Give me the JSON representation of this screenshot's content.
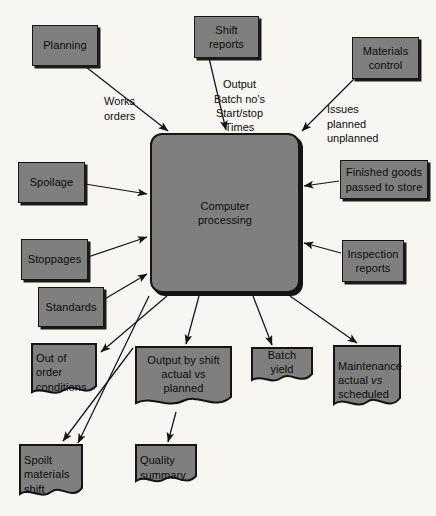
{
  "diagram": {
    "colors": {
      "node_fill": "#7f7f7f",
      "node_border": "#161616",
      "background": "#f7f6f3",
      "text": "#0b0b0b"
    },
    "process": {
      "label": "Computer\nprocessing",
      "line1": "Computer",
      "line2": "processing"
    },
    "inputs": [
      {
        "id": "planning",
        "label": "Planning"
      },
      {
        "id": "shift-reports",
        "label": "Shift\nreports",
        "line1": "Shift",
        "line2": "reports"
      },
      {
        "id": "materials-control",
        "label": "Materials\ncontrol",
        "line1": "Materials",
        "line2": "control"
      },
      {
        "id": "spoilage",
        "label": "Spoilage"
      },
      {
        "id": "stoppages",
        "label": "Stoppages"
      },
      {
        "id": "standards",
        "label": "Standards"
      },
      {
        "id": "finished-goods",
        "label": "Finished goods\npassed to store",
        "line1": "Finished goods",
        "line2": "passed to store"
      },
      {
        "id": "inspection-reports",
        "label": "Inspection\nreports",
        "line1": "Inspection",
        "line2": "reports"
      }
    ],
    "outputs": [
      {
        "id": "out-of-order-conditions",
        "label": "Out of\norder\nconditions",
        "line1": "Out of",
        "line2": "order",
        "line3": "conditions"
      },
      {
        "id": "output-by-shift",
        "label": "Output by shift\nactual vs planned",
        "line1": "Output by shift",
        "line2": "actual vs planned"
      },
      {
        "id": "batch-yield",
        "label": "Batch yield"
      },
      {
        "id": "maintenance",
        "label": "Maintenance\nactual vs\nscheduled",
        "line1": "Maintenance",
        "line2a": "actual",
        "line2b": "vs",
        "line3": "scheduled"
      },
      {
        "id": "spoilt-materials-shift",
        "label": "Spoilt\nmaterials\nshift",
        "line1": "Spoilt",
        "line2": "materials",
        "line3": "shift"
      },
      {
        "id": "quality-summary",
        "label": "Quality\nsummary",
        "line1": "Quality",
        "line2": "summary"
      }
    ],
    "edge_labels": [
      {
        "id": "works-orders",
        "text": "Works\norders"
      },
      {
        "id": "output-batch-times",
        "text": "Output\nBatch no's\nStart/stop\nTimes"
      },
      {
        "id": "issues-planned-unplanned",
        "text": "Issues\n planned\n unplanned"
      }
    ]
  }
}
